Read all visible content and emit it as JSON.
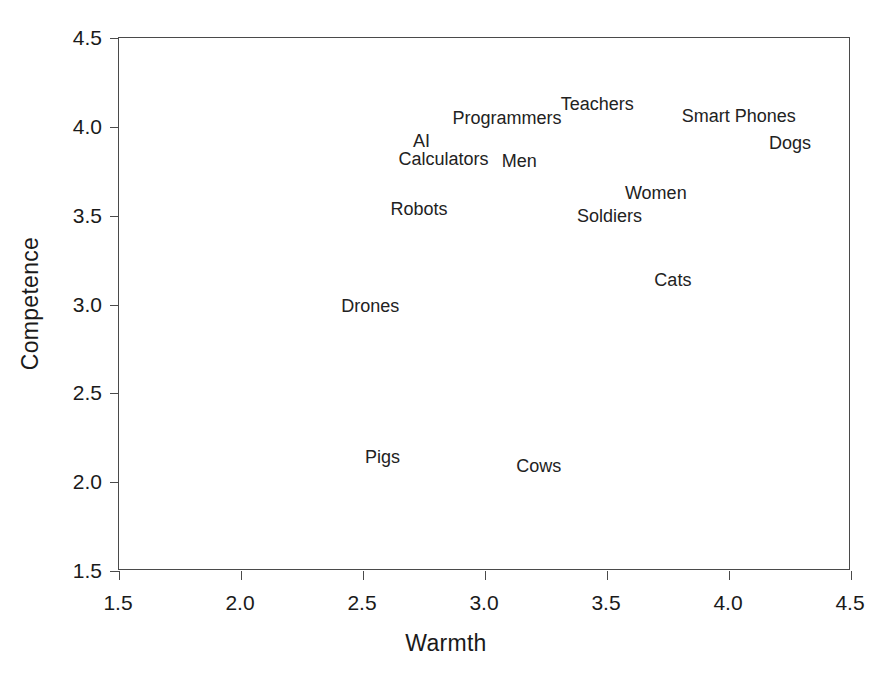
{
  "chart_data": {
    "type": "scatter",
    "title": "",
    "xlabel": "Warmth",
    "ylabel": "Competence",
    "xlim": [
      1.5,
      4.5
    ],
    "ylim": [
      1.5,
      4.5
    ],
    "xticks": [
      "1.5",
      "2.0",
      "2.5",
      "3.0",
      "3.5",
      "4.0",
      "4.5"
    ],
    "yticks": [
      "1.5",
      "2.0",
      "2.5",
      "3.0",
      "3.5",
      "4.0",
      "4.5"
    ],
    "grid": false,
    "legend": "none",
    "marker_style": "text-label-only",
    "points": [
      {
        "label": "Teachers",
        "x": 3.46,
        "y": 4.13
      },
      {
        "label": "Programmers",
        "x": 3.09,
        "y": 4.05
      },
      {
        "label": "Smart Phones",
        "x": 4.04,
        "y": 4.06
      },
      {
        "label": "AI",
        "x": 2.74,
        "y": 3.92
      },
      {
        "label": "Dogs",
        "x": 4.25,
        "y": 3.91
      },
      {
        "label": "Calculators",
        "x": 2.83,
        "y": 3.82
      },
      {
        "label": "Men",
        "x": 3.14,
        "y": 3.81
      },
      {
        "label": "Women",
        "x": 3.7,
        "y": 3.63
      },
      {
        "label": "Robots",
        "x": 2.73,
        "y": 3.54
      },
      {
        "label": "Soldiers",
        "x": 3.51,
        "y": 3.5
      },
      {
        "label": "Cats",
        "x": 3.77,
        "y": 3.14
      },
      {
        "label": "Drones",
        "x": 2.53,
        "y": 2.99
      },
      {
        "label": "Pigs",
        "x": 2.58,
        "y": 2.14
      },
      {
        "label": "Cows",
        "x": 3.22,
        "y": 2.09
      }
    ]
  },
  "colors": {
    "axis": "#4a4a4a",
    "text": "#1a1a1a",
    "background": "#ffffff"
  }
}
